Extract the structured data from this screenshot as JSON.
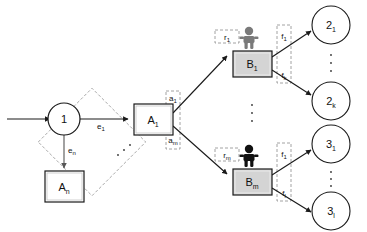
{
  "diagram": {
    "background_color": "#ffffff",
    "stroke_color": "#1a1a1a",
    "dashed_box_color": "#808080",
    "box_fill": "#f0f0f0",
    "person_gray": "#7a7a7a",
    "person_black": "#111111",
    "nodes": {
      "source_circle": {
        "id": "node-1",
        "label": "1",
        "shape": "circle"
      },
      "task_box_first": {
        "id": "node-A1",
        "label_main": "A",
        "label_sub": "1",
        "shape": "rect"
      },
      "task_box_last": {
        "id": "node-An",
        "label_main": "A",
        "label_sub": "n",
        "shape": "rect"
      },
      "agent_box_first": {
        "id": "node-B1",
        "label_main": "B",
        "label_sub": "1",
        "shape": "rect"
      },
      "agent_box_last": {
        "id": "node-Bm",
        "label_main": "B",
        "label_sub": "m",
        "shape": "rect"
      },
      "result_top_first": {
        "id": "node-2-1",
        "label_main": "2",
        "label_sub": "1",
        "shape": "circle"
      },
      "result_top_last": {
        "id": "node-2-k",
        "label_main": "2",
        "label_sub": "k",
        "shape": "circle"
      },
      "result_bottom_first": {
        "id": "node-3-1",
        "label_main": "3",
        "label_sub": "1",
        "shape": "circle"
      },
      "result_bottom_last": {
        "id": "node-3-l",
        "label_main": "3",
        "label_sub": "l",
        "shape": "circle"
      }
    },
    "edge_labels": {
      "e_first": {
        "main": "e",
        "sub": "1"
      },
      "e_last": {
        "main": "e",
        "sub": "n"
      },
      "a_first": {
        "main": "a",
        "sub": "1"
      },
      "a_last": {
        "main": "a",
        "sub": "m"
      },
      "r_first": {
        "main": "r",
        "sub": "1"
      },
      "r_last": {
        "main": "r",
        "sub": "m"
      },
      "f_top_first": {
        "main": "f",
        "sub": "1"
      },
      "f_top_last": {
        "main": "f",
        "sub": "k"
      },
      "f_bottom_first": {
        "main": "f",
        "sub": "1"
      },
      "f_bottom_last": {
        "main": "f",
        "sub": "l"
      }
    },
    "ellipses": {
      "between_a_edges": "⋰",
      "between_agents": "⋮",
      "between_results_top": "⋮",
      "between_results_bottom": "⋮"
    }
  }
}
